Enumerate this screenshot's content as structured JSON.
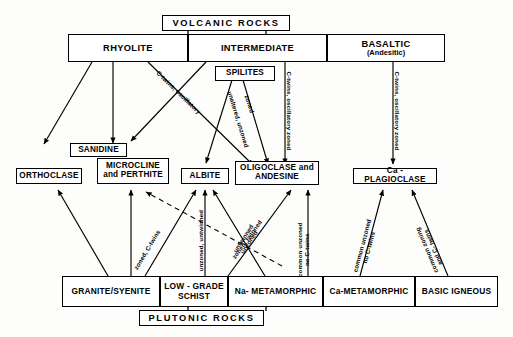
{
  "diagram": {
    "top_banner": {
      "label": "VOLCANIC  ROCKS"
    },
    "bottom_banner": {
      "label": "PLUTONIC   ROCKS"
    },
    "volcanic_groups": [
      {
        "id": "rhyolite",
        "label": "RHYOLITE"
      },
      {
        "id": "intermediate",
        "label": "INTERMEDIATE"
      },
      {
        "id": "basaltic",
        "label": "BASALTIC",
        "sublabel": "(Andesitic)"
      }
    ],
    "spilites": {
      "label": "SPILITES"
    },
    "minerals": [
      {
        "id": "sanidine",
        "label": "SANIDINE"
      },
      {
        "id": "orthoclase",
        "label": "ORTHOCLASE"
      },
      {
        "id": "microcline",
        "label": "MICROCLINE",
        "sublabel": "and PERTHITE"
      },
      {
        "id": "albite",
        "label": "ALBITE"
      },
      {
        "id": "oligoclase",
        "label": "OLIGOCLASE  and",
        "sublabel": "ANDESINE"
      },
      {
        "id": "ca_plagioclase",
        "label": "Ca - PLAGIOCLASE"
      }
    ],
    "plutonic_sources": [
      {
        "id": "granite_syenite",
        "label": "GRANITE/SYENITE"
      },
      {
        "id": "low_grade_schist",
        "label": "LOW - GRADE",
        "sublabel": "SCHIST"
      },
      {
        "id": "na_metamorphic",
        "label": "Na- METAMORPHIC"
      },
      {
        "id": "ca_metamorphic",
        "label": "Ca-METAMORPHIC"
      },
      {
        "id": "basic_igneous",
        "label": "BASIC  IGNEOUS"
      }
    ],
    "edge_labels": [
      {
        "id": "rhyolite_to_oligoclase",
        "text": "C-twins, oscillatory"
      },
      {
        "id": "spilites_to_albite",
        "text": "unaltered, unzoned"
      },
      {
        "id": "spilites_to_oligoclase",
        "text": "zoned"
      },
      {
        "id": "intermediate_to_oligoclase",
        "text": "C-twins, oscillatory zoned"
      },
      {
        "id": "basaltic_to_ca_plagioclase",
        "text": "C-twins, oscillatory zoned"
      },
      {
        "id": "granite_to_albite",
        "text": "zoned, C-twins"
      },
      {
        "id": "low_grade_schist_to_albite",
        "text": "unzoned, untwinned"
      },
      {
        "id": "na_metamorphic_to_albite",
        "text": "untwinned",
        "text2": "unzoned"
      },
      {
        "id": "na_metamorphic_to_oligoclase",
        "text": "zoned, twinned"
      },
      {
        "id": "ca_metamorphic_to_oligoclase",
        "text": "common unzoned",
        "text2": "no C-twins"
      },
      {
        "id": "ca_metamorphic_to_ca_plagioclase",
        "text": "common unzoned",
        "text2": "no C-twins"
      },
      {
        "id": "basic_igneous_to_ca_plagioclase",
        "text": "common zoning",
        "text2": "and  C- twins"
      }
    ]
  }
}
